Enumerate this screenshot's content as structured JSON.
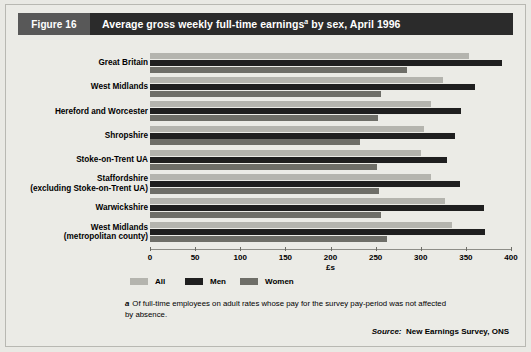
{
  "figure": {
    "number_label": "Figure 16",
    "title_main": "Average gross weekly full-time earnings",
    "title_sup": "a",
    "title_tail": " by sex, April 1996"
  },
  "footnote": {
    "marker": "a",
    "text": "Of full-time employees on adult rates whose pay for the survey pay-period was not affected by absence."
  },
  "source": {
    "prefix": "Source:",
    "text": "New Earnings Survey, ONS"
  },
  "legend": {
    "items": [
      {
        "label": "All",
        "color": "#b4b4ae"
      },
      {
        "label": "Men",
        "color": "#1f1f1f"
      },
      {
        "label": "Women",
        "color": "#6e6e68"
      }
    ]
  },
  "colors": {
    "title_bar": "#2b2b2b",
    "figure_tag": "#585858",
    "panel_bg": "#ebebe6",
    "all": "#b4b4ae",
    "men": "#1f1f1f",
    "women": "#6e6e68"
  },
  "chart_data": {
    "type": "bar",
    "orientation": "horizontal",
    "xlabel": "£s",
    "ylabel": "",
    "xlim": [
      0,
      400
    ],
    "xticks": [
      0,
      50,
      100,
      150,
      200,
      250,
      300,
      350,
      400
    ],
    "xticklabels": [
      "0",
      "50",
      "100",
      "150",
      "200",
      "250",
      "300",
      "350",
      "400"
    ],
    "grid": false,
    "legend_position": "bottom-left",
    "categories": [
      "Great Britain",
      "West Midlands",
      "Hereford and Worcester",
      "Shropshire",
      "Stoke-on-Trent UA",
      "Staffordshire\n(excluding Stoke-on-Trent UA)",
      "Warwickshire",
      "West Midlands\n(metropolitan county)"
    ],
    "series": [
      {
        "name": "All",
        "color": "#b4b4ae",
        "values": [
          354,
          325,
          311,
          304,
          300,
          311,
          327,
          335
        ]
      },
      {
        "name": "Men",
        "color": "#1f1f1f",
        "values": [
          390,
          360,
          345,
          338,
          329,
          343,
          370,
          371
        ]
      },
      {
        "name": "Women",
        "color": "#6e6e68",
        "values": [
          285,
          256,
          253,
          233,
          251,
          254,
          256,
          263
        ]
      }
    ]
  }
}
